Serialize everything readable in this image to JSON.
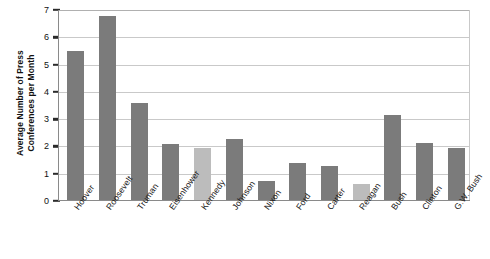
{
  "chart_data": {
    "type": "bar",
    "title": "",
    "xlabel": "",
    "ylabel": "Average Number of Press Conferences per Month",
    "ylabel_line1": "Average Number of Press",
    "ylabel_line2": "Conferences per Month",
    "ylim": [
      0,
      7
    ],
    "yticks": [
      0,
      1,
      2,
      3,
      4,
      5,
      6,
      7
    ],
    "grid": true,
    "legend": "none",
    "categories": [
      "Hoover",
      "Roosevelt",
      "Truman",
      "Eisenhower",
      "Kennedy",
      "Johnson",
      "Nixon",
      "Ford",
      "Carter",
      "Reagan",
      "Bush",
      "Clinton",
      "G.W. Bush"
    ],
    "values": [
      5.45,
      6.75,
      3.55,
      2.05,
      1.9,
      2.25,
      0.7,
      1.35,
      1.25,
      0.6,
      3.1,
      2.1,
      1.9
    ],
    "bar_shades": [
      "dark",
      "dark",
      "dark",
      "dark",
      "light",
      "dark",
      "dark",
      "dark",
      "dark",
      "light",
      "dark",
      "dark",
      "dark"
    ],
    "colors": {
      "bar_dark": "#7b7b7b",
      "bar_light": "#bcbcbc",
      "grid": "#c9c9c9",
      "axis": "#8a8a8a",
      "text": "#111111",
      "background": "#ffffff"
    }
  }
}
